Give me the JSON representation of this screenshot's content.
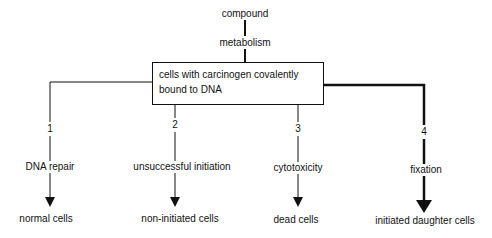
{
  "diagram": {
    "top": {
      "compound": "compound",
      "metabolism": "metabolism"
    },
    "central_box": {
      "line1": "cells with carcinogen covalently",
      "line2": "bound to DNA"
    },
    "branches": [
      {
        "number": "1",
        "process": "DNA repair",
        "outcome": "normal cells",
        "x": 50,
        "emphasis": false
      },
      {
        "number": "2",
        "process": "unsuccessful initiation",
        "outcome": "non-initiated cells",
        "x": 175,
        "emphasis": false
      },
      {
        "number": "3",
        "process": "cytotoxicity",
        "outcome": "dead cells",
        "x": 298,
        "emphasis": false
      },
      {
        "number": "4",
        "process": "fixation",
        "outcome": "initiated daughter cells",
        "x": 424,
        "emphasis": true
      }
    ],
    "colors": {
      "line": "#111111",
      "background": "#ffffff"
    }
  }
}
